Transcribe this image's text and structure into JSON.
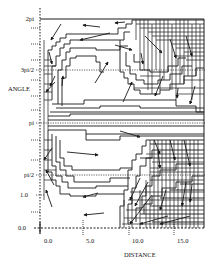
{
  "figure": {
    "type": "cell-mapping phase portrait",
    "corner_mark": "12"
  },
  "axes": {
    "y": {
      "title": "ANGLE",
      "ticks": [
        {
          "label": "2pi",
          "y": 18
        },
        {
          "label": "3pi/2",
          "y": 70
        },
        {
          "label": "pi",
          "y": 123
        },
        {
          "label": "pi/2",
          "y": 175
        },
        {
          "label": "1.0",
          "y": 195
        },
        {
          "label": "0.0",
          "y": 228
        }
      ]
    },
    "x": {
      "title": "DISTANCE",
      "ticks": [
        {
          "label": "0.0",
          "x": 40
        },
        {
          "label": "5.0",
          "x": 83
        },
        {
          "label": "10.0",
          "x": 129
        },
        {
          "label": "15.0",
          "x": 174
        }
      ]
    }
  },
  "colors": {
    "ink": "#1a1a1a",
    "background": "#ffffff"
  }
}
